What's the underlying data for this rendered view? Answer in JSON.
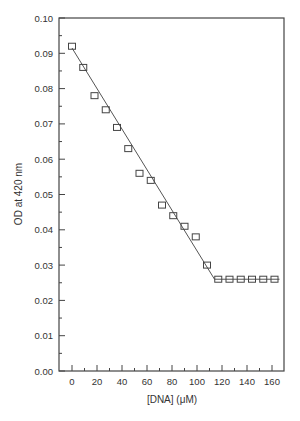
{
  "chart_data": {
    "type": "scatter",
    "title": "",
    "xlabel": "[DNA] (μM)",
    "ylabel": "OD at 420 nm",
    "xlim": [
      -6,
      170
    ],
    "ylim": [
      0.0,
      0.1
    ],
    "x_ticks": [
      0,
      20,
      40,
      60,
      80,
      100,
      120,
      140,
      160
    ],
    "x_tick_labels": [
      "0",
      "20",
      "40",
      "60",
      "80",
      "100",
      "120",
      "140",
      "160"
    ],
    "y_ticks": [
      0.0,
      0.01,
      0.02,
      0.03,
      0.04,
      0.05,
      0.06,
      0.07,
      0.08,
      0.09,
      0.1
    ],
    "y_tick_labels": [
      "0.00",
      "0.01",
      "0.02",
      "0.03",
      "0.04",
      "0.05",
      "0.06",
      "0.07",
      "0.08",
      "0.09",
      "0.10"
    ],
    "grid": false,
    "legend": null,
    "series": [
      {
        "name": "data",
        "marker": "open-square",
        "x": [
          0,
          9,
          18,
          27,
          36,
          45,
          54,
          63,
          72,
          81,
          90,
          99,
          108,
          117,
          126,
          135,
          144,
          153,
          162
        ],
        "y": [
          0.092,
          0.086,
          0.078,
          0.074,
          0.069,
          0.063,
          0.056,
          0.054,
          0.047,
          0.044,
          0.041,
          0.038,
          0.03,
          0.026,
          0.026,
          0.026,
          0.026,
          0.026,
          0.026
        ]
      },
      {
        "name": "fit",
        "type": "line",
        "x": [
          0,
          114,
          166
        ],
        "y": [
          0.0915,
          0.026,
          0.026
        ]
      }
    ]
  }
}
